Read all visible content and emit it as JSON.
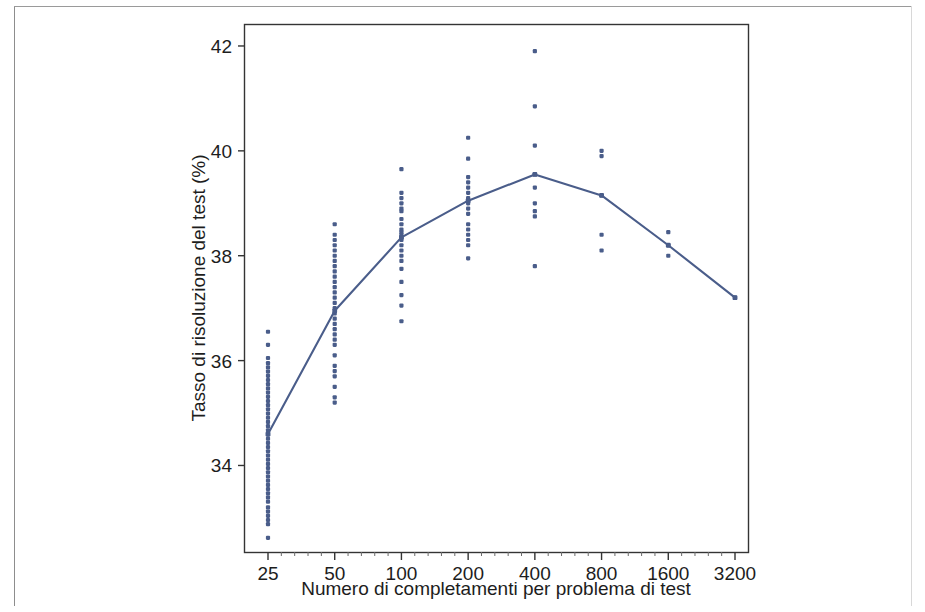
{
  "chart_data": {
    "type": "scatter",
    "title": "",
    "xlabel": "Numero di completamenti per problema di test",
    "ylabel": "Tasso di risoluzione del test (%)",
    "xscale": "log2",
    "x_tick_labels": [
      "25",
      "50",
      "100",
      "200",
      "400",
      "800",
      "1600",
      "3200"
    ],
    "x_tick_values": [
      25,
      50,
      100,
      200,
      400,
      800,
      1600,
      3200
    ],
    "y_tick_labels": [
      "34",
      "36",
      "38",
      "40",
      "42"
    ],
    "y_tick_values": [
      34,
      36,
      38,
      40,
      42
    ],
    "ylim": [
      32.35,
      42.4
    ],
    "grid": false,
    "legend": null,
    "line_color": "#4a5d8a",
    "point_color": "#4a5d8a",
    "series": [
      {
        "name": "Media",
        "type": "line",
        "x": [
          25,
          50,
          100,
          200,
          400,
          800,
          1600,
          3200
        ],
        "values": [
          34.6,
          36.95,
          38.35,
          39.05,
          39.55,
          39.15,
          38.2,
          37.2
        ]
      },
      {
        "name": "Campioni",
        "type": "scatter",
        "points_by_x": {
          "25": [
            36.55,
            36.3,
            36.05,
            35.95,
            35.87,
            35.79,
            35.71,
            35.63,
            35.55,
            35.47,
            35.39,
            35.31,
            35.23,
            35.15,
            35.07,
            34.99,
            34.91,
            34.83,
            34.75,
            34.67,
            34.59,
            34.51,
            34.43,
            34.35,
            34.27,
            34.19,
            34.11,
            34.03,
            33.95,
            33.87,
            33.79,
            33.71,
            33.63,
            33.55,
            33.47,
            33.39,
            33.31,
            33.2,
            33.12,
            33.04,
            32.96,
            32.88,
            32.62
          ],
          "50": [
            38.6,
            38.4,
            38.3,
            38.2,
            38.1,
            38.0,
            37.9,
            37.8,
            37.7,
            37.6,
            37.5,
            37.4,
            37.3,
            37.2,
            37.1,
            37.0,
            36.9,
            36.8,
            36.7,
            36.6,
            36.5,
            36.4,
            36.3,
            36.1,
            35.9,
            35.8,
            35.7,
            35.5,
            35.3,
            35.2
          ],
          "100": [
            39.65,
            39.2,
            39.1,
            39.0,
            38.9,
            38.85,
            38.7,
            38.6,
            38.5,
            38.45,
            38.4,
            38.35,
            38.3,
            38.2,
            38.1,
            38.0,
            37.9,
            37.75,
            37.5,
            37.25,
            37.05,
            36.75
          ],
          "200": [
            40.25,
            39.85,
            39.5,
            39.4,
            39.3,
            39.2,
            39.1,
            39.05,
            39.0,
            38.9,
            38.8,
            38.6,
            38.5,
            38.4,
            38.3,
            38.2,
            37.95
          ],
          "400": [
            41.9,
            40.85,
            40.1,
            39.55,
            39.3,
            39.0,
            38.85,
            38.75,
            37.8
          ],
          "800": [
            40.0,
            39.9,
            39.15,
            38.4,
            38.1
          ],
          "1600": [
            38.45,
            38.2,
            38.0
          ],
          "3200": [
            37.2
          ]
        }
      }
    ]
  }
}
